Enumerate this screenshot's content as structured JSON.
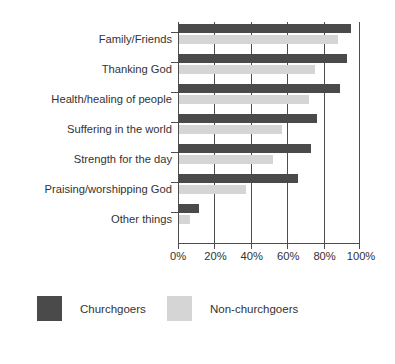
{
  "chart_data": {
    "type": "bar",
    "orientation": "horizontal",
    "title": "",
    "subtitle": "",
    "xlabel": "",
    "ylabel": "",
    "xlim": [
      0,
      100
    ],
    "xticks": [
      0,
      20,
      40,
      60,
      80,
      100
    ],
    "xtick_labels": [
      "0%",
      "20%",
      "40%",
      "60%",
      "80%",
      "100%"
    ],
    "grid": true,
    "grid_axis": "x",
    "legend_position": "bottom",
    "categories": [
      "Family/Friends",
      "Thanking God",
      "Health/healing of people",
      "Suffering in the world",
      "Strength for the day",
      "Praising/worshipping God",
      "Other things"
    ],
    "series": [
      {
        "name": "Churchgoers",
        "color": "#4a4a4a",
        "values": [
          95,
          93,
          89,
          76,
          73,
          66,
          11
        ]
      },
      {
        "name": "Non-churchgoers",
        "color": "#d5d5d5",
        "values": [
          88,
          75,
          72,
          57,
          52,
          37,
          6
        ]
      }
    ]
  },
  "legend": {
    "items": [
      {
        "label": "Churchgoers",
        "color": "#4a4a4a"
      },
      {
        "label": "Non-churchgoers",
        "color": "#d5d5d5"
      }
    ]
  },
  "colors": {
    "churchgoers": "#4a4a4a",
    "nonchurchgoers": "#d5d5d5",
    "axis": "#4d4d4d",
    "text": "#333333",
    "background": "#ffffff"
  }
}
